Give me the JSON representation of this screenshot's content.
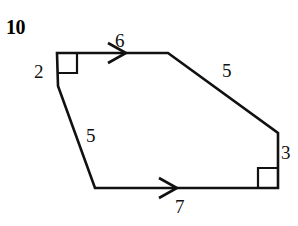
{
  "problem": {
    "number": "10"
  },
  "figure": {
    "kind": "hexagon-diagram",
    "stroke_color": "#111111",
    "background_color": "#ffffff",
    "stroke_width": 2.6,
    "vertices": [
      {
        "name": "top-left",
        "x": 57,
        "y": 53
      },
      {
        "name": "top-right",
        "x": 168,
        "y": 53
      },
      {
        "name": "right",
        "x": 278,
        "y": 133
      },
      {
        "name": "bottom-right",
        "x": 278,
        "y": 188
      },
      {
        "name": "bottom-left",
        "x": 95,
        "y": 188
      },
      {
        "name": "left",
        "x": 58,
        "y": 86
      }
    ],
    "side_labels": [
      {
        "name": "left-side",
        "text": "2",
        "x": 34,
        "y": 62
      },
      {
        "name": "top-side",
        "text": "6",
        "x": 115,
        "y": 31
      },
      {
        "name": "upper-right-side",
        "text": "5",
        "x": 222,
        "y": 61
      },
      {
        "name": "right-side",
        "text": "3",
        "x": 281,
        "y": 143
      },
      {
        "name": "bottom-side",
        "text": "7",
        "x": 175,
        "y": 197
      },
      {
        "name": "lower-left-side",
        "text": "5",
        "x": 86,
        "y": 126
      }
    ],
    "right_angle_markers": [
      {
        "name": "top-left-right-angle",
        "x": 57,
        "y": 53,
        "size": 20
      },
      {
        "name": "bottom-right-right-angle",
        "x": 278,
        "y": 188,
        "size": 20
      }
    ],
    "arrow_marks": [
      {
        "name": "top-edge-arrow",
        "x": 112,
        "y": 53,
        "direction": "right"
      },
      {
        "name": "bottom-edge-arrow",
        "x": 163,
        "y": 188,
        "direction": "right"
      }
    ]
  }
}
